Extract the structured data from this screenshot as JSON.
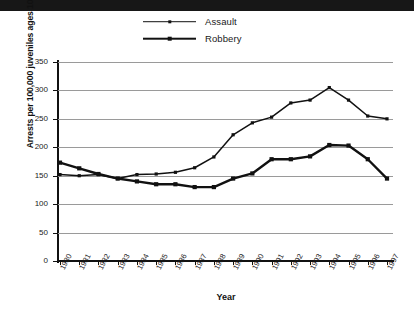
{
  "banner": {
    "present": true,
    "color": "#171717"
  },
  "caption": {
    "text": ""
  },
  "chart_data": {
    "type": "line",
    "title": "",
    "xlabel": "Year",
    "ylabel": "Arrests per 100,000 juveniles ages 10—17",
    "categories": [
      "1980",
      "1981",
      "1982",
      "1983",
      "1984",
      "1985",
      "1986",
      "1987",
      "1988",
      "1989",
      "1990",
      "1991",
      "1992",
      "1993",
      "1994",
      "1995",
      "1996",
      "1997"
    ],
    "yticks": [
      0,
      50,
      100,
      150,
      200,
      250,
      300,
      350
    ],
    "ylim": [
      0,
      350
    ],
    "grid": "horizontal",
    "legend_position": "top-center",
    "series": [
      {
        "name": "Assault",
        "color": "#111111",
        "marker": "square",
        "line_width": "thin",
        "values": [
          152,
          150,
          152,
          145,
          152,
          153,
          156,
          164,
          183,
          222,
          243,
          253,
          278,
          283,
          305,
          283,
          255,
          250
        ]
      },
      {
        "name": "Robbery",
        "color": "#111111",
        "marker": "square",
        "line_width": "thick",
        "values": [
          173,
          163,
          153,
          145,
          140,
          135,
          135,
          130,
          130,
          145,
          154,
          179,
          179,
          184,
          204,
          203,
          179,
          145
        ]
      }
    ]
  }
}
